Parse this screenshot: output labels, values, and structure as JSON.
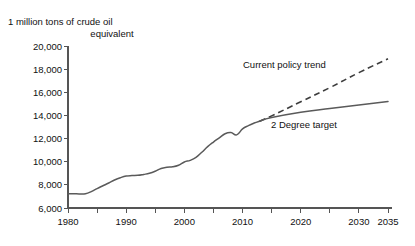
{
  "chart_data": {
    "type": "line",
    "title": "1 million tons of crude oil equivalent",
    "title_line1": "1 million tons of crude oil",
    "title_line2": "equivalent",
    "xlabel": "",
    "ylabel": "1 million tons of crude oil equivalent",
    "xlim": [
      1980,
      2035
    ],
    "ylim": [
      6000,
      20000
    ],
    "y_ticks": [
      6000,
      8000,
      10000,
      12000,
      14000,
      16000,
      18000,
      20000
    ],
    "y_tick_labels": [
      "6,000",
      "8,000",
      "10,000",
      "12,000",
      "14,000",
      "16,000",
      "18,000",
      "20,000"
    ],
    "x_ticks": [
      1980,
      1990,
      2000,
      2010,
      2020,
      2030,
      2035
    ],
    "x_tick_labels": [
      "1980",
      "1990",
      "2000",
      "2010",
      "2020",
      "2030",
      "2035"
    ],
    "x_minor_ticks": [
      1985,
      1995,
      2005,
      2015,
      2025
    ],
    "grid": false,
    "legend_position": "inline-annotations",
    "series": [
      {
        "name": "Historical",
        "style": "solid",
        "color": "#5a5a5a",
        "x": [
          1980,
          1981,
          1982,
          1983,
          1984,
          1985,
          1986,
          1987,
          1988,
          1989,
          1990,
          1991,
          1992,
          1993,
          1994,
          1995,
          1996,
          1997,
          1998,
          1999,
          2000,
          2001,
          2002,
          2003,
          2004,
          2005,
          2006,
          2007,
          2008,
          2009,
          2010,
          2011,
          2012,
          2013
        ],
        "values": [
          7230,
          7230,
          7220,
          7240,
          7420,
          7680,
          7920,
          8160,
          8420,
          8620,
          8760,
          8800,
          8820,
          8900,
          9000,
          9180,
          9420,
          9520,
          9560,
          9700,
          9980,
          10120,
          10380,
          10820,
          11300,
          11700,
          12060,
          12420,
          12520,
          12320,
          12840,
          13120,
          13340,
          13520
        ]
      },
      {
        "name": "Current policy trend",
        "style": "dashed",
        "color": "#3d3d3d",
        "x": [
          2013,
          2015,
          2020,
          2025,
          2030,
          2035
        ],
        "values": [
          13520,
          13960,
          15180,
          16400,
          17700,
          18900
        ]
      },
      {
        "name": "2 Degree target",
        "style": "solid",
        "color": "#5a5a5a",
        "x": [
          2013,
          2015,
          2020,
          2025,
          2030,
          2035
        ],
        "values": [
          13520,
          13820,
          14280,
          14600,
          14900,
          15200
        ]
      }
    ],
    "annotations": [
      {
        "text": "Current policy trend",
        "x": 2019,
        "y": 17600
      },
      {
        "text": "2 Degree target",
        "x": 2021,
        "y": 13400
      }
    ]
  },
  "annotations": {
    "current_policy_trend": "Current policy trend",
    "two_degree_target": "2 Degree target"
  }
}
